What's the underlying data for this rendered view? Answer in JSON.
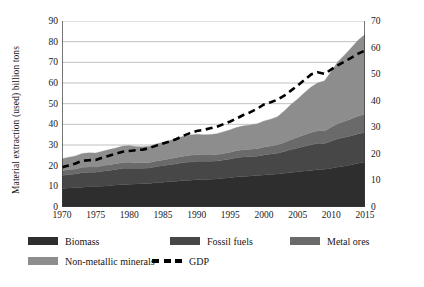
{
  "chart_data": {
    "type": "area",
    "title": "",
    "subtitle": "",
    "xlabel": "",
    "ylabel": "Material extraction (used) billion tons",
    "y2label": "GDP trillion $, 2005 prices",
    "grid": true,
    "legend_position": "bottom",
    "xlim": [
      1970,
      2015
    ],
    "ylim": [
      0,
      90
    ],
    "y2lim": [
      0,
      70
    ],
    "yticks": [
      0,
      10,
      20,
      30,
      40,
      50,
      60,
      70,
      80,
      90
    ],
    "y2ticks": [
      0,
      10,
      20,
      30,
      40,
      50,
      60,
      70
    ],
    "xticks": [
      1970,
      1975,
      1980,
      1985,
      1990,
      1995,
      2000,
      2005,
      2010,
      2015
    ],
    "x_minor_tick_step": 1,
    "x": [
      1970,
      1971,
      1972,
      1973,
      1974,
      1975,
      1976,
      1977,
      1978,
      1979,
      1980,
      1981,
      1982,
      1983,
      1984,
      1985,
      1986,
      1987,
      1988,
      1989,
      1990,
      1991,
      1992,
      1993,
      1994,
      1995,
      1996,
      1997,
      1998,
      1999,
      2000,
      2001,
      2002,
      2003,
      2004,
      2005,
      2006,
      2007,
      2008,
      2009,
      2010,
      2011,
      2012,
      2013,
      2014,
      2015
    ],
    "stacked": true,
    "series": [
      {
        "name": "Biomass",
        "color": "#2e2e2e",
        "axis": "left",
        "values": [
          9.0,
          9.2,
          9.3,
          9.6,
          9.8,
          9.9,
          10.1,
          10.3,
          10.6,
          10.8,
          11.0,
          11.1,
          11.3,
          11.4,
          11.8,
          12.0,
          12.3,
          12.5,
          12.8,
          13.0,
          13.2,
          13.3,
          13.4,
          13.6,
          13.9,
          14.2,
          14.6,
          14.8,
          15.0,
          15.2,
          15.5,
          15.7,
          16.0,
          16.3,
          16.7,
          17.0,
          17.4,
          17.7,
          18.1,
          18.3,
          18.8,
          19.3,
          19.8,
          20.4,
          21.2,
          21.8
        ]
      },
      {
        "name": "Fossil fuels",
        "color": "#474747",
        "axis": "left",
        "values": [
          6.2,
          6.5,
          6.7,
          7.0,
          7.0,
          6.9,
          7.2,
          7.4,
          7.6,
          7.9,
          7.8,
          7.6,
          7.5,
          7.5,
          7.8,
          8.0,
          8.2,
          8.4,
          8.7,
          8.8,
          8.9,
          8.8,
          8.7,
          8.7,
          8.8,
          9.0,
          9.3,
          9.4,
          9.4,
          9.4,
          9.7,
          9.9,
          10.0,
          10.5,
          11.1,
          11.6,
          12.0,
          12.4,
          12.7,
          12.4,
          13.1,
          13.7,
          13.9,
          14.1,
          14.2,
          14.2
        ]
      },
      {
        "name": "Metal ores",
        "color": "#6a6a6a",
        "axis": "left",
        "values": [
          2.3,
          2.4,
          2.4,
          2.6,
          2.6,
          2.5,
          2.6,
          2.7,
          2.7,
          2.8,
          2.8,
          2.7,
          2.6,
          2.6,
          2.7,
          2.8,
          2.9,
          3.0,
          3.1,
          3.2,
          3.2,
          3.1,
          3.1,
          3.1,
          3.2,
          3.3,
          3.4,
          3.5,
          3.5,
          3.6,
          3.8,
          3.9,
          4.1,
          4.4,
          4.8,
          5.1,
          5.5,
          5.9,
          6.1,
          6.1,
          6.8,
          7.4,
          7.8,
          8.2,
          8.6,
          8.9
        ]
      },
      {
        "name": "Non-metallic minerals",
        "color": "#8d8d8d",
        "axis": "left",
        "values": [
          5.8,
          6.0,
          6.3,
          6.7,
          6.8,
          6.8,
          7.1,
          7.4,
          7.7,
          8.0,
          8.1,
          7.9,
          7.8,
          7.9,
          8.2,
          8.5,
          8.8,
          9.2,
          9.6,
          9.8,
          9.9,
          9.8,
          9.9,
          10.1,
          10.5,
          10.9,
          11.3,
          11.6,
          11.8,
          12.1,
          12.6,
          13.0,
          13.6,
          15.2,
          17.0,
          18.6,
          20.4,
          22.1,
          23.2,
          24.3,
          27.0,
          30.0,
          32.2,
          34.5,
          36.8,
          38.6
        ]
      },
      {
        "name": "GDP",
        "color": "#000000",
        "axis": "right",
        "style": "dashed",
        "values": [
          15.0,
          15.6,
          16.4,
          17.4,
          17.6,
          17.7,
          18.6,
          19.3,
          20.1,
          20.8,
          21.1,
          21.4,
          21.6,
          22.2,
          23.1,
          23.9,
          24.7,
          25.6,
          26.8,
          27.8,
          28.6,
          29.0,
          29.6,
          30.2,
          31.2,
          32.2,
          33.4,
          34.7,
          35.7,
          37.0,
          38.6,
          39.4,
          40.4,
          41.9,
          43.8,
          45.7,
          47.8,
          49.9,
          50.7,
          50.1,
          51.8,
          53.4,
          54.8,
          56.2,
          57.7,
          58.9
        ]
      }
    ]
  },
  "legend": {
    "rows": [
      [
        {
          "label": "Biomass",
          "color": "#2e2e2e",
          "type": "swatch",
          "icon": "legend-swatch-icon"
        },
        {
          "label": "Fossil fuels",
          "color": "#474747",
          "type": "swatch",
          "icon": "legend-swatch-icon"
        },
        {
          "label": "Metal ores",
          "color": "#6a6a6a",
          "type": "swatch",
          "icon": "legend-swatch-icon"
        }
      ],
      [
        {
          "label": "Non-metallic minerals",
          "color": "#8d8d8d",
          "type": "swatch",
          "icon": "legend-swatch-icon"
        },
        {
          "label": "GDP",
          "color": "#000000",
          "type": "dash",
          "icon": "legend-dash-icon"
        }
      ]
    ]
  },
  "style": {
    "background": "#ffffff",
    "grid_color": "#a8a8a8",
    "axis_color": "#3c3c3c",
    "text_color": "#161616"
  }
}
